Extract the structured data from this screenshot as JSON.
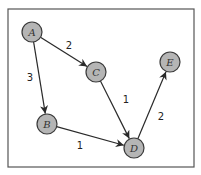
{
  "diagram": {
    "type": "directed-weighted-graph",
    "frame": {
      "x": 8,
      "y": 9,
      "width": 186,
      "height": 158
    },
    "node_radius": 10,
    "colors": {
      "node_fill": "#b5b5b5",
      "node_stroke": "#3a3a3a",
      "edge": "#2a2a2a",
      "frame": "#555555"
    },
    "nodes": [
      {
        "id": "A",
        "label": "A",
        "x": 32,
        "y": 32
      },
      {
        "id": "C",
        "label": "C",
        "x": 96,
        "y": 72
      },
      {
        "id": "E",
        "label": "E",
        "x": 170,
        "y": 62
      },
      {
        "id": "B",
        "label": "B",
        "x": 47,
        "y": 124
      },
      {
        "id": "D",
        "label": "D",
        "x": 134,
        "y": 148
      }
    ],
    "edges": [
      {
        "from": "A",
        "to": "C",
        "weight": "2",
        "label_x": 69,
        "label_y": 45
      },
      {
        "from": "A",
        "to": "B",
        "weight": "3",
        "label_x": 30,
        "label_y": 77
      },
      {
        "from": "C",
        "to": "D",
        "weight": "1",
        "label_x": 126,
        "label_y": 99
      },
      {
        "from": "B",
        "to": "D",
        "weight": "1",
        "label_x": 80,
        "label_y": 145
      },
      {
        "from": "D",
        "to": "E",
        "weight": "2",
        "label_x": 161,
        "label_y": 116
      }
    ]
  }
}
